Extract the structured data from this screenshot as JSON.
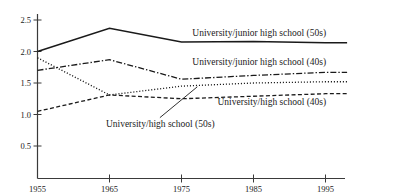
{
  "chart_data": {
    "type": "line",
    "title": "",
    "xlabel": "",
    "ylabel": "",
    "x": [
      1955,
      1965,
      1975,
      1985,
      1995
    ],
    "xtick_labels": [
      "1955",
      "1965",
      "1975",
      "1985",
      "1995"
    ],
    "ytick_labels": [
      "0.5",
      "1.0",
      "1.5",
      "2.0",
      "2.5"
    ],
    "yticks": [
      0.5,
      1.0,
      1.5,
      2.0,
      2.5
    ],
    "xlim": [
      1955,
      1998
    ],
    "ylim": [
      0.25,
      2.62
    ],
    "grid": false,
    "legend_position": "inline-right",
    "series": [
      {
        "name": "University/junior high school (50s)",
        "style": "solid",
        "color": "#1a1a1a",
        "values": [
          2.0,
          2.37,
          2.15,
          2.16,
          2.14
        ],
        "label_x": 1976.5,
        "label_y": 2.3
      },
      {
        "name": "University/junior high school (40s)",
        "style": "dash-dot",
        "color": "#1a1a1a",
        "values": [
          1.7,
          1.87,
          1.56,
          1.62,
          1.67
        ],
        "label_x": 1976.5,
        "label_y": 1.84
      },
      {
        "name": "University/high school (40s)",
        "style": "dashed",
        "color": "#1a1a1a",
        "values": [
          1.05,
          1.31,
          1.25,
          1.29,
          1.33
        ],
        "label_x": 1980.0,
        "label_y": 1.2
      },
      {
        "name": "University/high school (50s)",
        "style": "dotted",
        "color": "#1a1a1a",
        "values": [
          1.9,
          1.31,
          1.45,
          1.5,
          1.52
        ],
        "label_x": 1964.5,
        "label_y": 0.85,
        "annotation": {
          "leader_from_x": 1977.2,
          "leader_from_y": 1.44,
          "leader_to_x": 1972.0,
          "leader_to_y": 0.95
        }
      }
    ]
  },
  "axis": {
    "line_color": "#3a3a3a"
  }
}
